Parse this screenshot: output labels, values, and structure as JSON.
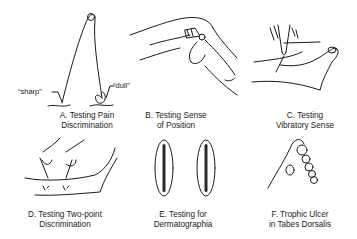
{
  "figure": {
    "panels": [
      {
        "id": "A",
        "caption_line1": "A. Testing Pain",
        "caption_line2": "Discrimination",
        "labels": {
          "sharp": "“sharp”",
          "dull": "“dull”"
        },
        "illustration": "safety-pin"
      },
      {
        "id": "B",
        "caption_line1": "B. Testing Sense",
        "caption_line2": "of Position",
        "illustration": "fingers-holding-toe"
      },
      {
        "id": "C",
        "caption_line1": "C. Testing",
        "caption_line2": "Vibratory Sense",
        "illustration": "tuning-fork-on-foot"
      },
      {
        "id": "D",
        "caption_line1": "D. Testing Two-point",
        "caption_line2": "Discrimination",
        "illustration": "two-hands-with-pins"
      },
      {
        "id": "E",
        "caption_line1": "E. Testing for",
        "caption_line2": "Dermatographia",
        "illustration": "two-stroke-marks"
      },
      {
        "id": "F",
        "caption_line1": "F. Trophic Ulcer",
        "caption_line2": "in Tabes Dorsalis",
        "illustration": "foot-sole-ulcer"
      }
    ]
  }
}
